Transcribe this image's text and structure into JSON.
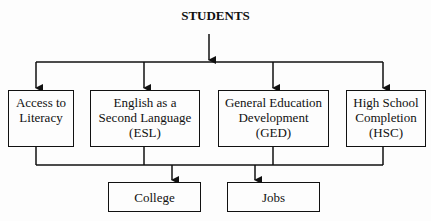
{
  "title": "STUDENTS",
  "programs": [
    {
      "id": "literacy",
      "label_lines": [
        "Access to",
        "Literacy"
      ]
    },
    {
      "id": "esl",
      "label_lines": [
        "English as a",
        "Second Language",
        "(ESL)"
      ]
    },
    {
      "id": "ged",
      "label_lines": [
        "General Education",
        "Development",
        "(GED)"
      ]
    },
    {
      "id": "hsc",
      "label_lines": [
        "High School",
        "Completion",
        "(HSC)"
      ]
    }
  ],
  "outcomes": [
    {
      "id": "college",
      "label": "College"
    },
    {
      "id": "jobs",
      "label": "Jobs"
    }
  ],
  "colors": {
    "line": "#111111",
    "background": "#fdfdfd"
  }
}
